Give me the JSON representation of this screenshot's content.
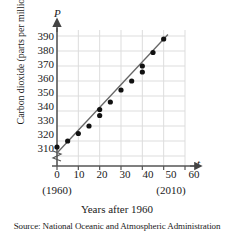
{
  "chart_data": {
    "type": "scatter",
    "title": "",
    "xlabel": "Years after 1960",
    "ylabel": "Carbon dioxide (parts per million)",
    "x_axis_symbol": "t",
    "y_axis_symbol": "P",
    "xlim": [
      0,
      60
    ],
    "ylim": [
      305,
      395
    ],
    "xticks": [
      0,
      10,
      20,
      30,
      40,
      50,
      60
    ],
    "xtick_labels": [
      "0",
      "10",
      "20",
      "30",
      "40",
      "50",
      "60"
    ],
    "yticks": [
      310,
      320,
      330,
      340,
      350,
      360,
      370,
      380,
      390
    ],
    "ytick_labels": [
      "310",
      "320",
      "330",
      "340",
      "350",
      "360",
      "370",
      "380",
      "390"
    ],
    "x_annotations": [
      {
        "x": 0,
        "label": "(1960)"
      },
      {
        "x": 50,
        "label": "(2010)"
      }
    ],
    "grid": true,
    "axis_break": true,
    "legend": "none",
    "points": [
      {
        "x": 0,
        "y": 316
      },
      {
        "x": 5,
        "y": 320
      },
      {
        "x": 10,
        "y": 325
      },
      {
        "x": 15,
        "y": 330
      },
      {
        "x": 20,
        "y": 337
      },
      {
        "x": 20,
        "y": 341
      },
      {
        "x": 25,
        "y": 346
      },
      {
        "x": 30,
        "y": 354
      },
      {
        "x": 35,
        "y": 360
      },
      {
        "x": 40,
        "y": 366
      },
      {
        "x": 40,
        "y": 370
      },
      {
        "x": 45,
        "y": 379
      },
      {
        "x": 50,
        "y": 388
      }
    ],
    "trend_line": {
      "type": "line",
      "from": {
        "x": 0,
        "y": 312
      },
      "to": {
        "x": 52,
        "y": 391
      }
    },
    "source": "Source: National Oceanic and Atmospheric Administration",
    "colors": {
      "point": "#111111",
      "line": "#555555",
      "grid": "#d8d8d8",
      "axis": "#444444",
      "text": "#1a1a1a"
    }
  }
}
